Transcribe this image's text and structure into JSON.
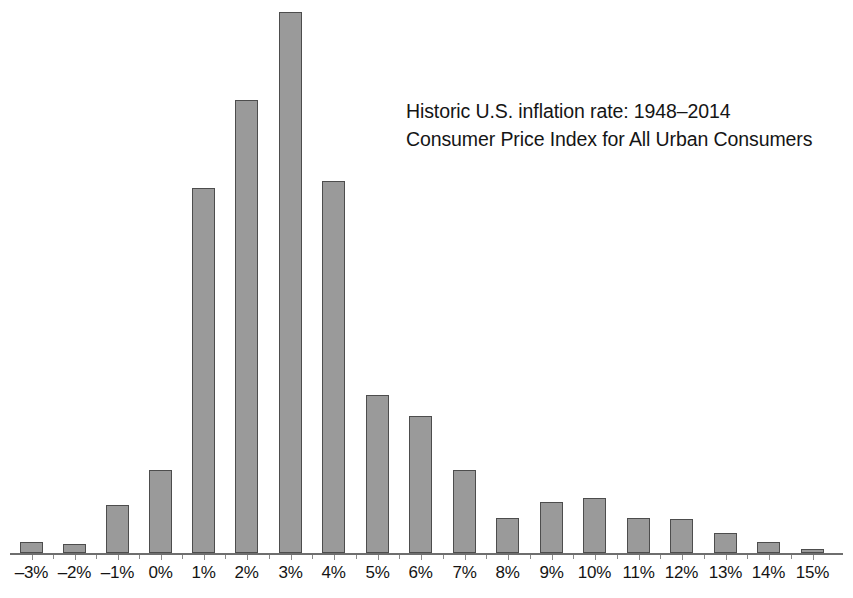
{
  "annotation": {
    "line1": "Historic U.S. inflation rate: 1948–2014",
    "line2": "Consumer Price Index for All Urban Consumers"
  },
  "axis": {
    "baseline_color": "#6e6e6e",
    "tick_color": "#8a8a8a"
  },
  "style": {
    "bar_fill": "#9a9a9a",
    "bar_border": "#4d4d4d",
    "background": "#ffffff",
    "text_color": "#141414"
  },
  "chart_data": {
    "type": "bar",
    "title": "Historic U.S. inflation rate: 1948–2014",
    "subtitle": "Consumer Price Index for All Urban Consumers",
    "xlabel": "",
    "ylabel": "",
    "grid": false,
    "legend": "none",
    "annotations": [
      "Historic U.S. inflation rate: 1948–2014",
      "Consumer Price Index for All Urban Consumers"
    ],
    "categories": [
      "-3%",
      "-2%",
      "-1%",
      "0%",
      "1%",
      "2%",
      "3%",
      "4%",
      "5%",
      "6%",
      "7%",
      "8%",
      "9%",
      "10%",
      "11%",
      "12%",
      "13%",
      "14%",
      "15%"
    ],
    "tick_labels": [
      "–3%",
      "–2%",
      "–1%",
      "0%",
      "1%",
      "2%",
      "3%",
      "4%",
      "5%",
      "6%",
      "7%",
      "8%",
      "9%",
      "10%",
      "11%",
      "12%",
      "13%",
      "14%",
      "15%"
    ],
    "values": [
      1,
      1,
      2,
      2,
      9,
      12,
      14,
      10,
      4,
      3,
      2,
      1,
      1,
      1,
      1,
      1,
      1,
      1,
      1
    ],
    "bar_pixel_heights": [
      11,
      9,
      48,
      83,
      365,
      453,
      541,
      372,
      158,
      137,
      83,
      35,
      51,
      55,
      35,
      34,
      20,
      11,
      4
    ],
    "ylim": [
      0,
      14
    ],
    "bars": [
      {
        "category": "-3%",
        "label": "–3%",
        "value": 1,
        "pixel_height": 11,
        "x": 20
      },
      {
        "category": "-2%",
        "label": "–2%",
        "value": 1,
        "pixel_height": 9,
        "x": 63
      },
      {
        "category": "-1%",
        "label": "–1%",
        "value": 1,
        "pixel_height": 48,
        "x": 106
      },
      {
        "category": "0%",
        "label": "0%",
        "value": 2,
        "pixel_height": 83,
        "x": 149
      },
      {
        "category": "1%",
        "label": "1%",
        "value": 9,
        "pixel_height": 365,
        "x": 192
      },
      {
        "category": "2%",
        "label": "2%",
        "value": 12,
        "pixel_height": 453,
        "x": 235
      },
      {
        "category": "3%",
        "label": "3%",
        "value": 14,
        "pixel_height": 541,
        "x": 279
      },
      {
        "category": "4%",
        "label": "4%",
        "value": 10,
        "pixel_height": 372,
        "x": 322
      },
      {
        "category": "5%",
        "label": "5%",
        "value": 4,
        "pixel_height": 158,
        "x": 366
      },
      {
        "category": "6%",
        "label": "6%",
        "value": 3,
        "pixel_height": 137,
        "x": 409
      },
      {
        "category": "7%",
        "label": "7%",
        "value": 2,
        "pixel_height": 83,
        "x": 453
      },
      {
        "category": "8%",
        "label": "8%",
        "value": 1,
        "pixel_height": 35,
        "x": 496
      },
      {
        "category": "9%",
        "label": "9%",
        "value": 1,
        "pixel_height": 51,
        "x": 540
      },
      {
        "category": "10%",
        "label": "10%",
        "value": 1,
        "pixel_height": 55,
        "x": 583
      },
      {
        "category": "11%",
        "label": "11%",
        "value": 1,
        "pixel_height": 35,
        "x": 627
      },
      {
        "category": "12%",
        "label": "12%",
        "value": 1,
        "pixel_height": 34,
        "x": 670
      },
      {
        "category": "13%",
        "label": "13%",
        "value": 1,
        "pixel_height": 20,
        "x": 714
      },
      {
        "category": "14%",
        "label": "14%",
        "value": 1,
        "pixel_height": 11,
        "x": 757
      },
      {
        "category": "15%",
        "label": "15%",
        "value": 1,
        "pixel_height": 4,
        "x": 801
      }
    ]
  },
  "layout": {
    "baseline_y": 553,
    "bar_width": 23,
    "axis_left": 10,
    "axis_width": 833
  }
}
